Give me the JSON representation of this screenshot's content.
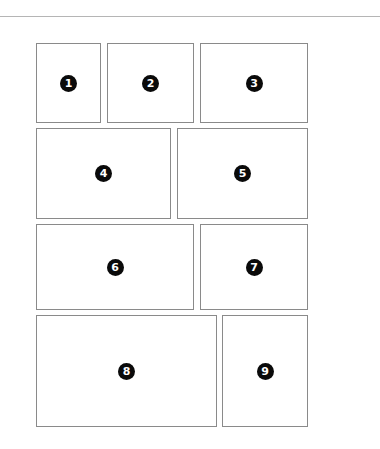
{
  "diagram": {
    "title": "",
    "rule_color": "#b5b5b5",
    "panel_border_color": "#8a8a8a",
    "badge_color": "#0a0a0a",
    "panels": [
      {
        "label": "1",
        "x": 36,
        "y": 43,
        "w": 65,
        "h": 80
      },
      {
        "label": "2",
        "x": 107,
        "y": 43,
        "w": 87,
        "h": 80
      },
      {
        "label": "3",
        "x": 200,
        "y": 43,
        "w": 108,
        "h": 80
      },
      {
        "label": "4",
        "x": 36,
        "y": 128,
        "w": 135,
        "h": 91
      },
      {
        "label": "5",
        "x": 177,
        "y": 128,
        "w": 131,
        "h": 91
      },
      {
        "label": "6",
        "x": 36,
        "y": 224,
        "w": 158,
        "h": 86
      },
      {
        "label": "7",
        "x": 200,
        "y": 224,
        "w": 108,
        "h": 86
      },
      {
        "label": "8",
        "x": 36,
        "y": 315,
        "w": 181,
        "h": 112
      },
      {
        "label": "9",
        "x": 222,
        "y": 315,
        "w": 86,
        "h": 112
      }
    ]
  }
}
